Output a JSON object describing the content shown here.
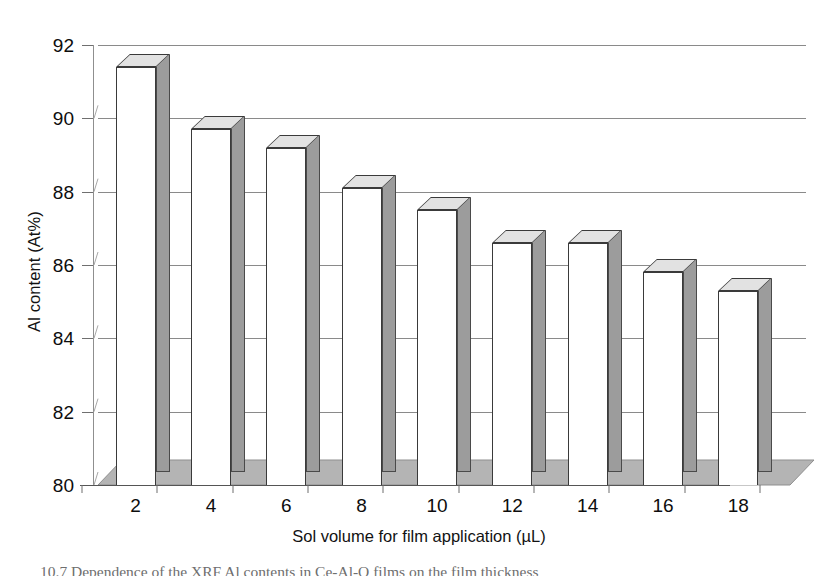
{
  "figure": {
    "caption_partial": "10.7  Dependence of the XRF Al contents in Ce-Al-O films on the film thickness"
  },
  "chart_data": {
    "type": "bar",
    "title": "",
    "subtitle": "",
    "xlabel": "Sol volume for film application (µL)",
    "ylabel": "Al content (At%)",
    "categories": [
      "2",
      "4",
      "6",
      "8",
      "10",
      "12",
      "14",
      "16",
      "18"
    ],
    "values": [
      91.4,
      89.7,
      89.2,
      88.1,
      87.5,
      86.6,
      86.6,
      85.8,
      85.3
    ],
    "series": [
      {
        "name": "Al content",
        "values": [
          91.4,
          89.7,
          89.2,
          88.1,
          87.5,
          86.6,
          86.6,
          85.8,
          85.3
        ]
      }
    ],
    "ylim": [
      80,
      92
    ],
    "yticks": [
      80,
      82,
      84,
      86,
      88,
      90,
      92
    ],
    "ytick_labels": [
      "80",
      "82",
      "84",
      "86",
      "88",
      "90",
      "92"
    ],
    "xtick_labels": [
      "2",
      "4",
      "6",
      "8",
      "10",
      "12",
      "14",
      "16",
      "18"
    ],
    "grid": true,
    "grid_axis": "y",
    "legend": false,
    "legend_position": "none",
    "style": "3d-column",
    "bar_face_color": "#ffffff",
    "bar_side_color": "#9c9c9c",
    "bar_top_color": "#e2e2e2",
    "bar_edge_color": "#3a3a3a",
    "floor_color": "#b4b4b4",
    "grid_color": "#8a8a8a",
    "background_color": "#ffffff"
  }
}
